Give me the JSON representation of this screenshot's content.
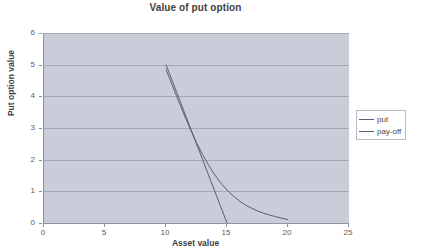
{
  "chart_data": {
    "type": "line",
    "title": "Value of put option",
    "xlabel": "Asset value",
    "ylabel": "Put option value",
    "xlim": [
      0,
      25
    ],
    "ylim": [
      0,
      6
    ],
    "xticks": [
      "0",
      "5",
      "10",
      "15",
      "20",
      "25"
    ],
    "yticks": [
      "0",
      "1",
      "2",
      "3",
      "4",
      "5",
      "6"
    ],
    "grid": "horizontal",
    "legend_position": "right",
    "plot_background": "#c9cdd9",
    "line_color": "#5a5f73",
    "series": [
      {
        "name": "put",
        "x": [
          10.0,
          10.5,
          11.0,
          11.5,
          12.0,
          12.5,
          13.0,
          13.5,
          14.0,
          14.5,
          15.0,
          15.5,
          16.0,
          16.5,
          17.0,
          17.5,
          18.0,
          18.5,
          19.0,
          19.5,
          20.0
        ],
        "values": [
          4.85,
          4.36,
          3.88,
          3.41,
          2.96,
          2.54,
          2.16,
          1.82,
          1.52,
          1.26,
          1.04,
          0.86,
          0.7,
          0.57,
          0.47,
          0.38,
          0.31,
          0.25,
          0.2,
          0.15,
          0.11
        ]
      },
      {
        "name": "pay-off",
        "x": [
          10.0,
          15.0
        ],
        "values": [
          5.0,
          0.0
        ]
      }
    ]
  },
  "legend": {
    "entries": [
      {
        "label": "put"
      },
      {
        "label": "pay-off"
      }
    ]
  }
}
